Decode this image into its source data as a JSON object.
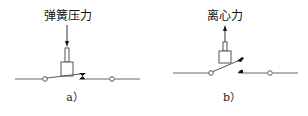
{
  "diagrams": [
    {
      "id": "a",
      "force_label": "弹簧压力",
      "force_direction": "down",
      "caption": "a）",
      "state": "closed-by-spring"
    },
    {
      "id": "b",
      "force_label": "离心力",
      "force_direction": "up",
      "caption": "b）",
      "state": "opened-by-centrifugal-force"
    }
  ],
  "colors": {
    "line": "#555555",
    "contact": "#111111",
    "background": "#ffffff"
  }
}
